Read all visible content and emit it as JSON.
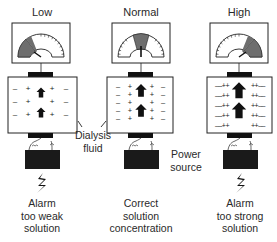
{
  "panels": [
    {
      "id": "low",
      "title": "Low",
      "meter_zone": "left",
      "caption": [
        "Alarm",
        "too weak",
        "solution"
      ],
      "alarm": true,
      "ion_pattern": "sparse"
    },
    {
      "id": "normal",
      "title": "Normal",
      "meter_zone": "center",
      "caption": [
        "Correct",
        "solution",
        "concentration"
      ],
      "alarm": false,
      "ion_pattern": "medium"
    },
    {
      "id": "high",
      "title": "High",
      "meter_zone": "right",
      "caption": [
        "Alarm",
        "too strong",
        "solution"
      ],
      "alarm": true,
      "ion_pattern": "dense"
    }
  ],
  "annotations": {
    "dialysis_fluid": [
      "Dialysis",
      "fluid"
    ],
    "power_source": [
      "Power",
      "source"
    ]
  },
  "colors": {
    "line": "#222222",
    "meter_shade": "#6e6e6e",
    "battery": "#1a1a1a",
    "background": "#ffffff"
  }
}
